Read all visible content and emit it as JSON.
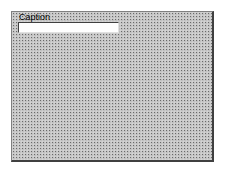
{
  "form": {
    "caption_label": "Caption",
    "caption_input_value": "",
    "background_pattern": "dotted-grid",
    "colors": {
      "frame_fill": "#c0c0c0",
      "grid_dots": "#6a6a6a",
      "border_dark": "#404040",
      "input_fill": "#ffffff"
    }
  }
}
